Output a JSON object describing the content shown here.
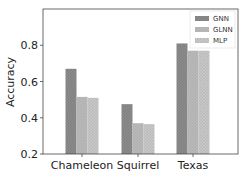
{
  "chart_data": {
    "type": "bar",
    "title": "",
    "xlabel": "",
    "ylabel": "Accuracy",
    "ylim": [
      0.2,
      1.0
    ],
    "yticks": [
      0.2,
      0.4,
      0.6,
      0.8
    ],
    "ytick_labels": [
      "0.2",
      "0.4",
      "0.6",
      "0.8"
    ],
    "categories": [
      "Chameleon",
      "Squirrel",
      "Texas"
    ],
    "series": [
      {
        "name": "GNN",
        "values": [
          0.67,
          0.475,
          0.81
        ],
        "color": "#8a8a8a"
      },
      {
        "name": "GLNN",
        "values": [
          0.515,
          0.37,
          0.77
        ],
        "color": "#b5b5b5"
      },
      {
        "name": "MLP",
        "values": [
          0.51,
          0.365,
          0.77
        ],
        "color": "#c6c6c6"
      }
    ],
    "grid": false,
    "legend_position": "upper right"
  }
}
